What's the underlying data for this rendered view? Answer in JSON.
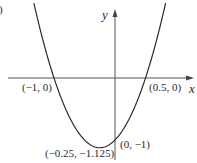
{
  "chart_data": {
    "type": "line",
    "title": "",
    "function": "y = 2x^2 + x - 1",
    "xlabel": "x",
    "ylabel": "y",
    "xlim": [
      -1.75,
      1.3
    ],
    "ylim": [
      -1.3,
      1.1
    ],
    "grid": false,
    "legend": null,
    "series": [
      {
        "name": "parabola",
        "x": [
          -1.33,
          -1.25,
          -1.0,
          -0.75,
          -0.5,
          -0.25,
          0.0,
          0.25,
          0.5,
          0.75,
          0.83
        ],
        "y": [
          1.21,
          0.875,
          0.0,
          -0.625,
          -1.0,
          -1.125,
          -1.0,
          -0.625,
          0.0,
          0.875,
          1.21
        ]
      }
    ],
    "annotations": [
      {
        "text": "(−1, 0)",
        "x": -1,
        "y": 0,
        "kind": "x-intercept"
      },
      {
        "text": "(0.5, 0)",
        "x": 0.5,
        "y": 0,
        "kind": "x-intercept"
      },
      {
        "text": "(0, −1)",
        "x": 0,
        "y": -1,
        "kind": "y-intercept"
      },
      {
        "text": "(−0.25, −1.125)",
        "x": -0.25,
        "y": -1.125,
        "kind": "vertex"
      }
    ]
  },
  "labels": {
    "x_axis": "x",
    "y_axis": "y",
    "x_intercept_left": "(−1, 0)",
    "x_intercept_right": "(0.5, 0)",
    "y_intercept": "(0, −1)",
    "vertex": "(−0.25, −1.125)",
    "panel_fragment": ")"
  },
  "colors": {
    "curve": "#2a2a2a",
    "axes": "#555555",
    "text": "#2a2a2a",
    "background": "#ffffff"
  }
}
